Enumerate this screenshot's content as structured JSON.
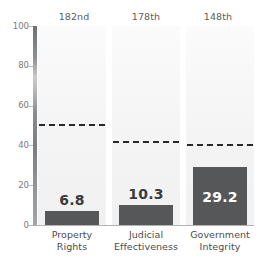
{
  "chart_data": {
    "type": "bar",
    "title": "",
    "subtitle": "",
    "xlabel": "",
    "ylabel": "",
    "ylim": [
      0,
      100
    ],
    "grid": false,
    "legend_position": "none",
    "categories": [
      "Property Rights",
      "Judicial Effectiveness",
      "Government Integrity"
    ],
    "values": [
      6.8,
      10.3,
      29.2
    ],
    "value_labels": [
      "6.8",
      "10.3",
      "29.2"
    ],
    "rank_annotations": [
      "182nd",
      "178th",
      "148th"
    ],
    "reference_lines": [
      51.0,
      42.0,
      40.5
    ],
    "reference_line_style": "dashed",
    "ytick_labels": [
      "100",
      "80",
      "60",
      "40",
      "20",
      "0"
    ],
    "ytick_values": [
      100,
      80,
      60,
      40,
      20,
      0
    ],
    "bar_color": "#555759",
    "panel_color": "#f4f4f4",
    "reference_line_color": "#26282a",
    "axis_color": "#8a8d90",
    "label_color": "#4a4c4e",
    "rank_color": "#5d5d5d"
  }
}
